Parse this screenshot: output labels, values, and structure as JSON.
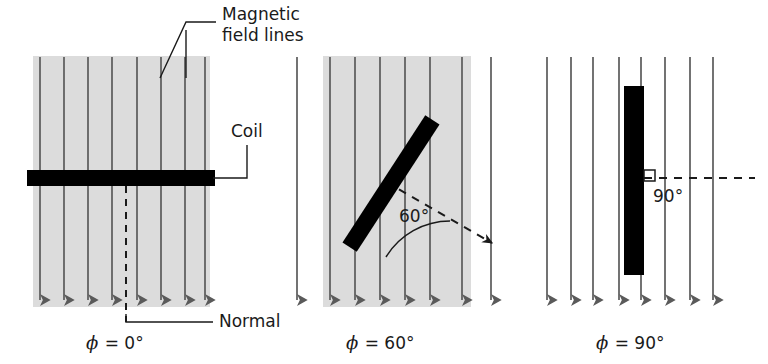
{
  "figure": {
    "type": "physics-diagram",
    "background_color": "#ffffff",
    "ink_color": "#1a1a1a",
    "field_line_color": "#5a5a5a",
    "shade_color": "#dcdcdc",
    "coil_color": "#000000"
  },
  "annotations": {
    "magnetic_field_lines_label_line1": "Magnetic",
    "magnetic_field_lines_label_line2": "field lines",
    "coil_label": "Coil",
    "normal_label": "Normal"
  },
  "panels": [
    {
      "id": "panel-0",
      "caption_phi": "ϕ",
      "caption_eq": " = 0°",
      "caption_full": "ϕ = 0°",
      "angle_value": "0°",
      "angle_label": "",
      "coil_orientation": "horizontal",
      "shaded": true,
      "field_line_count": 8,
      "has_normal_line": true,
      "has_right_angle_marker": false
    },
    {
      "id": "panel-60",
      "caption_phi": "ϕ",
      "caption_eq": " = 60°",
      "caption_full": "ϕ = 60°",
      "angle_value": "60°",
      "angle_label": "60°",
      "coil_orientation": "tilted",
      "shaded": true,
      "field_line_count": 8,
      "has_normal_line": true,
      "has_right_angle_marker": false
    },
    {
      "id": "panel-90",
      "caption_phi": "ϕ",
      "caption_eq": " = 90°",
      "caption_full": "ϕ = 90°",
      "angle_value": "90°",
      "angle_label": "90°",
      "coil_orientation": "vertical",
      "shaded": false,
      "field_line_count": 8,
      "has_normal_line": true,
      "has_right_angle_marker": true
    }
  ]
}
